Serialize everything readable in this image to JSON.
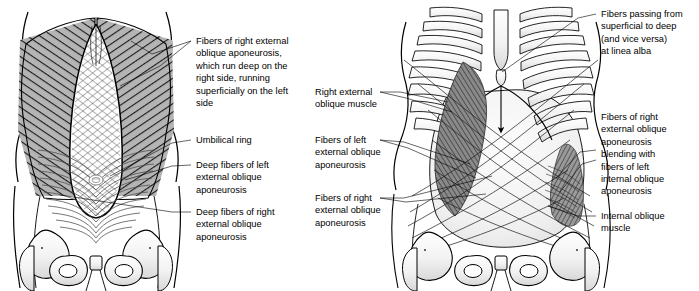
{
  "figure": {
    "type": "anatomical-illustration",
    "background_color": "#ffffff",
    "ink_color": "#000000",
    "shade_gray": "#b0b0b0",
    "panels": [
      {
        "id": "left",
        "name": "superficial-dissection-panel",
        "description": "Anterior abdominal wall with external oblique aponeurosis fibers and pelvis"
      },
      {
        "id": "right",
        "name": "deep-dissection-panel",
        "description": "Thorax, rib cage, oblique muscles and crossing aponeurotic fibers with pelvis"
      }
    ]
  },
  "left_panel": {
    "labels": [
      {
        "name": "label-right-external-oblique-aponeurosis",
        "lines": [
          "Fibers of right external",
          "oblique aponeurosis,",
          "which run deep on the",
          "right side, running",
          "superficially on the left",
          "side"
        ]
      },
      {
        "name": "label-umbilical-ring",
        "lines": [
          "Umbilical ring"
        ]
      },
      {
        "name": "label-deep-fibers-left-external-oblique",
        "lines": [
          "Deep fibers of left",
          "external oblique",
          "aponeurosis"
        ]
      },
      {
        "name": "label-deep-fibers-right-external-oblique",
        "lines": [
          "Deep fibers of right",
          "external oblique",
          "aponeurosis"
        ]
      }
    ]
  },
  "right_panel": {
    "labels": [
      {
        "name": "label-right-external-oblique-muscle",
        "lines": [
          "Right external",
          "oblique muscle"
        ]
      },
      {
        "name": "label-fibers-left-external-oblique-aponeurosis",
        "lines": [
          "Fibers of left",
          "external oblique",
          "aponeurosis"
        ]
      },
      {
        "name": "label-fibers-right-external-oblique-aponeurosis",
        "lines": [
          "Fibers of right",
          "external oblique",
          "aponeurosis"
        ]
      },
      {
        "name": "label-fibers-passing-linea-alba",
        "lines": [
          "Fibers passing from",
          "superficial to deep",
          "(and vice versa)",
          "at linea alba"
        ]
      },
      {
        "name": "label-fibers-blending-internal-oblique",
        "lines": [
          "Fibers of right",
          "external oblique",
          "aponeurosis",
          "blending with",
          "fibers of left",
          "internal oblique",
          "aponeurosis"
        ]
      },
      {
        "name": "label-internal-oblique-muscle",
        "lines": [
          "Internal oblique",
          "muscle"
        ]
      }
    ]
  }
}
